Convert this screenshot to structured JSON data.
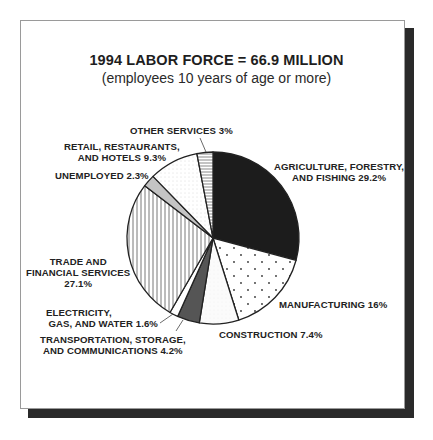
{
  "chart_data": {
    "type": "pie",
    "title": "1994 LABOR FORCE = 66.9 MILLION",
    "subtitle": "(employees 10 years of age or more)",
    "start_angle_deg": 0,
    "direction": "clockwise",
    "slices": [
      {
        "key": "agriculture",
        "label_lines": [
          "AGRICULTURE, FORESTRY,",
          "AND FISHING 29.2%"
        ],
        "value": 29.2,
        "fill": "solid-black"
      },
      {
        "key": "manufacturing",
        "label_lines": [
          "MANUFACTURING 16%"
        ],
        "value": 16.0,
        "fill": "sparse-dots"
      },
      {
        "key": "construction",
        "label_lines": [
          "CONSTRUCTION 7.4%"
        ],
        "value": 7.4,
        "fill": "light-fine-dots"
      },
      {
        "key": "transportation",
        "label_lines": [
          "TRANSPORTATION, STORAGE,",
          "AND COMMUNICATIONS 4.2%"
        ],
        "value": 4.2,
        "fill": "dark-gray"
      },
      {
        "key": "electricity",
        "label_lines": [
          "ELECTRICITY,",
          "GAS, AND  WATER 1.6%"
        ],
        "value": 1.6,
        "fill": "white"
      },
      {
        "key": "trade",
        "label_lines": [
          "TRADE AND",
          "FINANCIAL SERVICES",
          "27.1%"
        ],
        "value": 27.1,
        "fill": "vertical-lines"
      },
      {
        "key": "unemployed",
        "label_lines": [
          "UNEMPLOYED 2.3%"
        ],
        "value": 2.3,
        "fill": "light-gray"
      },
      {
        "key": "retail",
        "label_lines": [
          "RETAIL, RESTAURANTS,",
          "AND HOTELS 9.3%"
        ],
        "value": 9.3,
        "fill": "fine-dots"
      },
      {
        "key": "other_services",
        "label_lines": [
          "OTHER SERVICES 3%"
        ],
        "value": 3.0,
        "fill": "horizontal-lines"
      }
    ],
    "categories": [
      "Agriculture, Forestry, and Fishing",
      "Manufacturing",
      "Construction",
      "Transportation, Storage, and Communications",
      "Electricity, Gas, and Water",
      "Trade and Financial Services",
      "Unemployed",
      "Retail, Restaurants, and Hotels",
      "Other Services"
    ],
    "values": [
      29.2,
      16.0,
      7.4,
      4.2,
      1.6,
      27.1,
      2.3,
      9.3,
      3.0
    ],
    "unit": "%",
    "legend": "none (direct labels)"
  },
  "labels": {
    "agriculture": {
      "l1": "AGRICULTURE, FORESTRY,",
      "l2": "AND FISHING 29.2%"
    },
    "manufacturing": {
      "l1": "MANUFACTURING 16%"
    },
    "construction": {
      "l1": "CONSTRUCTION 7.4%"
    },
    "transportation": {
      "l1": "TRANSPORTATION, STORAGE,",
      "l2": "AND COMMUNICATIONS 4.2%"
    },
    "electricity": {
      "l1": "ELECTRICITY,",
      "l2": "GAS, AND  WATER 1.6%"
    },
    "trade": {
      "l1": "TRADE AND",
      "l2": "FINANCIAL SERVICES",
      "l3": "27.1%"
    },
    "unemployed": {
      "l1": "UNEMPLOYED 2.3%"
    },
    "retail": {
      "l1": "RETAIL, RESTAURANTS,",
      "l2": "AND HOTELS 9.3%"
    },
    "other_services": {
      "l1": "OTHER SERVICES 3%"
    }
  },
  "colors": {
    "frame_border": "#9a9a9a",
    "shadow": "#2a2a2a",
    "agriculture": "#1c1c1c",
    "transportation": "#555555",
    "unemployed": "#c4c4c4",
    "outline": "#222222"
  }
}
